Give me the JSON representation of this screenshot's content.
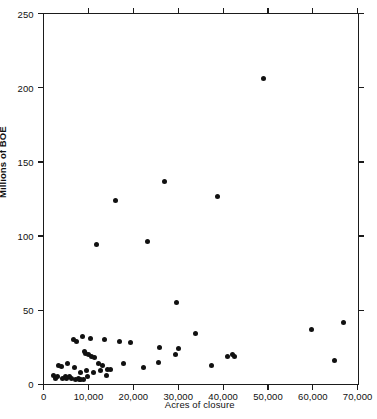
{
  "chart_data": {
    "type": "scatter",
    "title": "",
    "xlabel": "Acres of closure",
    "ylabel": "Millions of BOE",
    "xlim": [
      0,
      70000
    ],
    "ylim": [
      0,
      250
    ],
    "grid": false,
    "legend": null,
    "marker": {
      "shape": "circle",
      "color": "#111111",
      "size": 5
    },
    "xticks": [
      0,
      10000,
      20000,
      30000,
      40000,
      50000,
      60000,
      70000
    ],
    "xticklabels": [
      "0",
      "10,000",
      "20,000",
      "30,000",
      "40,000",
      "50,000",
      "60,000",
      "70,000"
    ],
    "yticks": [
      0,
      50,
      100,
      150,
      200,
      250
    ],
    "yticklabels": [
      "0",
      "50",
      "100",
      "150",
      "200",
      "250"
    ],
    "series": [
      {
        "name": "fields",
        "points": [
          [
            2200,
            6
          ],
          [
            2600,
            4
          ],
          [
            3000,
            5
          ],
          [
            3300,
            13
          ],
          [
            3900,
            12
          ],
          [
            4300,
            4
          ],
          [
            4800,
            5
          ],
          [
            5100,
            4
          ],
          [
            5400,
            14
          ],
          [
            5700,
            5
          ],
          [
            6200,
            4
          ],
          [
            6600,
            30
          ],
          [
            6900,
            11
          ],
          [
            7100,
            3
          ],
          [
            7400,
            29
          ],
          [
            7700,
            4
          ],
          [
            7900,
            3
          ],
          [
            8100,
            8
          ],
          [
            8300,
            3
          ],
          [
            8600,
            32
          ],
          [
            8800,
            3
          ],
          [
            9100,
            22
          ],
          [
            9300,
            21
          ],
          [
            9600,
            9
          ],
          [
            9800,
            5
          ],
          [
            10100,
            20
          ],
          [
            10400,
            31
          ],
          [
            10700,
            19
          ],
          [
            11000,
            8
          ],
          [
            11400,
            18
          ],
          [
            11800,
            94
          ],
          [
            12200,
            14
          ],
          [
            12700,
            9
          ],
          [
            13100,
            13
          ],
          [
            13500,
            30
          ],
          [
            13900,
            6
          ],
          [
            14300,
            10
          ],
          [
            14800,
            10
          ],
          [
            15900,
            124
          ],
          [
            16900,
            29
          ],
          [
            17800,
            14
          ],
          [
            19400,
            28
          ],
          [
            22300,
            11
          ],
          [
            23100,
            96
          ],
          [
            25600,
            15
          ],
          [
            25800,
            25
          ],
          [
            26900,
            137
          ],
          [
            29300,
            20
          ],
          [
            29700,
            55
          ],
          [
            30100,
            24
          ],
          [
            33900,
            34
          ],
          [
            37400,
            13
          ],
          [
            38700,
            127
          ],
          [
            40900,
            19
          ],
          [
            42100,
            20
          ],
          [
            42500,
            19
          ],
          [
            49000,
            206
          ],
          [
            59800,
            37
          ],
          [
            64900,
            16
          ],
          [
            66900,
            42
          ]
        ]
      }
    ]
  },
  "figure": {
    "x_axis_title": "Acres of closure",
    "y_axis_title": "Millions of BOE",
    "caption": ""
  }
}
